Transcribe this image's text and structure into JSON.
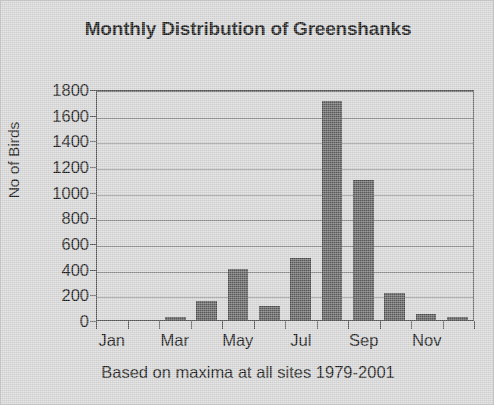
{
  "chart_data": {
    "type": "bar",
    "title": "Monthly Distribution of Greenshanks",
    "subtitle": "",
    "xlabel": "Based on maxima at all sites 1979-2001",
    "ylabel": "No of Birds",
    "categories": [
      "Jan",
      "Feb",
      "Mar",
      "Apr",
      "May",
      "Jun",
      "Jul",
      "Aug",
      "Sep",
      "Oct",
      "Nov",
      "Dec"
    ],
    "visible_tick_labels": [
      "Jan",
      "",
      "Mar",
      "",
      "May",
      "",
      "Jul",
      "",
      "Sep",
      "",
      "Nov",
      ""
    ],
    "values": [
      0,
      0,
      25,
      145,
      400,
      110,
      480,
      1710,
      1090,
      210,
      45,
      25
    ],
    "ylim": [
      0,
      1800
    ],
    "ytick_values": [
      0,
      200,
      400,
      600,
      800,
      1000,
      1200,
      1400,
      1600,
      1800
    ],
    "ytick_labels": [
      "0",
      "200",
      "400",
      "600",
      "800",
      "1000",
      "1200",
      "1400",
      "1600",
      "1800"
    ],
    "grid": true,
    "grid_axis": "y",
    "legend": false,
    "legend_position": "none",
    "bar_color": "#5c5c5c",
    "plot_background_color": "#d6d6d6",
    "figure_background_color": "#d6d6d6",
    "axis_color": "#555555",
    "grid_color": "#8d8d8d",
    "text_color": "#141414"
  }
}
